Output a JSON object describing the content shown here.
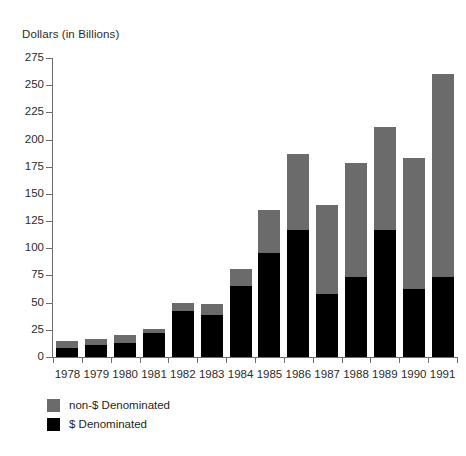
{
  "chart_data": {
    "type": "bar",
    "subtype": "stacked-vertical",
    "title": "Dollars (in Billions)",
    "xlabel": "",
    "ylabel": "Dollars (in Billions)",
    "ylim": [
      0,
      275
    ],
    "ytick_step": 25,
    "yticks": [
      275,
      250,
      225,
      200,
      175,
      150,
      125,
      100,
      75,
      50,
      25,
      0
    ],
    "ytick_labels": [
      "275",
      "250",
      "225",
      "200",
      "175",
      "150",
      "125",
      "100",
      "75",
      "50",
      "25",
      "0"
    ],
    "categories": [
      "1978",
      "1979",
      "1980",
      "1981",
      "1982",
      "1983",
      "1984",
      "1985",
      "1986",
      "1987",
      "1988",
      "1989",
      "1990",
      "1991"
    ],
    "grid": false,
    "legend_position": "bottom-left",
    "series": [
      {
        "name": "$ Denominated",
        "color": "#000000",
        "values": [
          8,
          11,
          13,
          22,
          42,
          39,
          65,
          96,
          117,
          58,
          74,
          117,
          63,
          74
        ]
      },
      {
        "name": "non-$ Denominated",
        "color": "#6b6b6b",
        "values": [
          7,
          6,
          7,
          4,
          8,
          10,
          16,
          39,
          70,
          82,
          104,
          95,
          120,
          186
        ]
      }
    ],
    "totals": [
      15,
      17,
      20,
      26,
      50,
      49,
      81,
      135,
      187,
      140,
      178,
      212,
      183,
      260
    ]
  },
  "legend": {
    "items": [
      {
        "label": "non-$ Denominated",
        "color": "#6b6b6b"
      },
      {
        "label": "$ Denominated",
        "color": "#000000"
      }
    ]
  },
  "colors": {
    "non_dollar": "#6b6b6b",
    "dollar": "#000000",
    "axis": "#6d6d6d",
    "text": "#2b2b2b",
    "background": "#ffffff"
  }
}
